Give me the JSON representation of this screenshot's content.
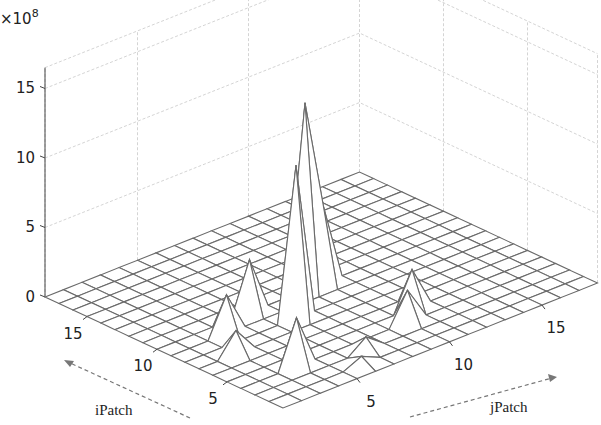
{
  "chart_data": {
    "type": "surface3d",
    "title": "",
    "xlabel": "jPatch",
    "ylabel": "iPatch",
    "zlabel": "",
    "z_multiplier_label": "×10",
    "z_multiplier_exponent": "8",
    "x_range": [
      1,
      18
    ],
    "y_range": [
      1,
      18
    ],
    "zlim": [
      0,
      15
    ],
    "x_ticks": [
      "5",
      "10",
      "15"
    ],
    "x_tick_values": [
      5,
      10,
      15
    ],
    "y_ticks": [
      "5",
      "10",
      "15"
    ],
    "y_tick_values": [
      5,
      10,
      15
    ],
    "z_ticks": [
      "0",
      "5",
      "10",
      "15"
    ],
    "z_tick_values": [
      0,
      5,
      10,
      15
    ],
    "grid": true,
    "baseline_value": 0,
    "peaks": [
      {
        "iPatch": 10,
        "jPatch": 9,
        "value": 13.5
      },
      {
        "iPatch": 8,
        "jPatch": 7,
        "value": 11
      },
      {
        "iPatch": 10,
        "jPatch": 10,
        "value": 5.5
      },
      {
        "iPatch": 10,
        "jPatch": 6,
        "value": 3.8
      },
      {
        "iPatch": 9,
        "jPatch": 4,
        "value": 2.8
      },
      {
        "iPatch": 7,
        "jPatch": 3,
        "value": 1.7
      },
      {
        "iPatch": 4,
        "jPatch": 4,
        "value": 3.5
      },
      {
        "iPatch": 5,
        "jPatch": 11,
        "value": 2.8
      },
      {
        "iPatch": 4,
        "jPatch": 10,
        "value": 2.3
      },
      {
        "iPatch": 3,
        "jPatch": 7,
        "value": 1.0
      },
      {
        "iPatch": 2,
        "jPatch": 6,
        "value": 0.6
      }
    ]
  }
}
